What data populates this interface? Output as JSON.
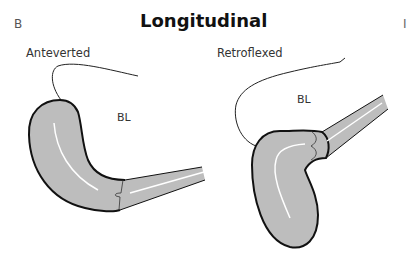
{
  "figure": {
    "panel_letter": "B",
    "edge_letter": "I",
    "title": "Longitudinal",
    "left": {
      "label": "Anteverted",
      "organ_label": "BL"
    },
    "right": {
      "label": "Retroflexed",
      "organ_label": "BL"
    },
    "colors": {
      "uterus_fill": "#bdbdbd",
      "outline": "#111111",
      "canal": "#ffffff",
      "bladder_line": "#222222"
    }
  }
}
